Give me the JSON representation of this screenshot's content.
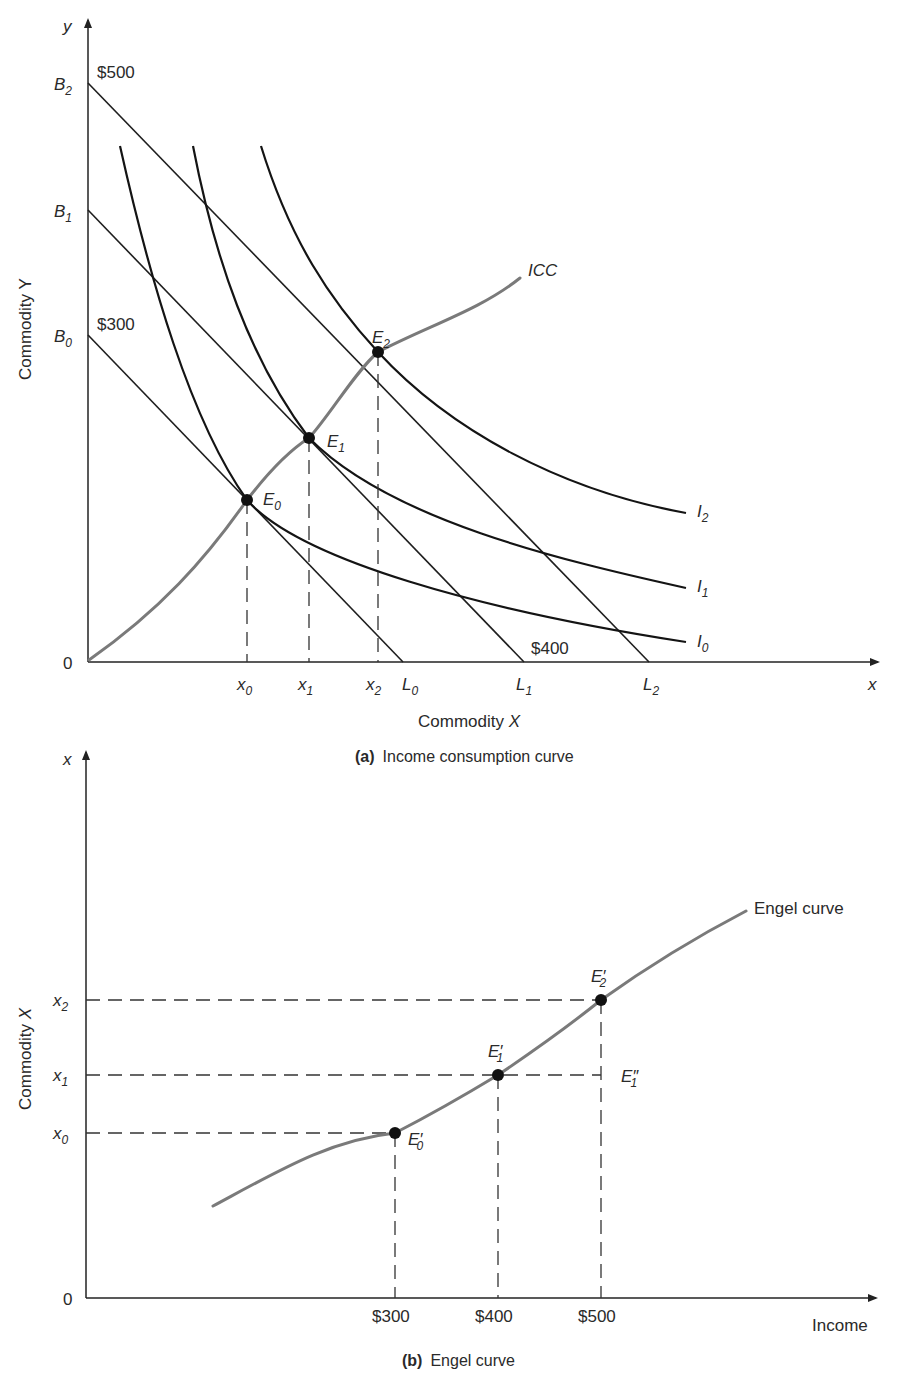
{
  "panel_a": {
    "caption_tag": "(a)",
    "caption_text": "Income consumption curve",
    "y_axis_symbol": "y",
    "x_axis_symbol": "x",
    "y_axis_title": "Commodity Y",
    "x_axis_title": "Commodity X",
    "origin": "0",
    "budget_intercepts_y": [
      {
        "base": "B",
        "sub": "0"
      },
      {
        "base": "B",
        "sub": "1"
      },
      {
        "base": "B",
        "sub": "2"
      }
    ],
    "budget_intercepts_x": [
      {
        "base": "L",
        "sub": "0"
      },
      {
        "base": "L",
        "sub": "1"
      },
      {
        "base": "L",
        "sub": "2"
      }
    ],
    "income_labels": {
      "b0": "$300",
      "b2": "$500",
      "l1": "$400"
    },
    "x_ticks": [
      {
        "base": "x",
        "sub": "0"
      },
      {
        "base": "x",
        "sub": "1"
      },
      {
        "base": "x",
        "sub": "2"
      }
    ],
    "equilibria": [
      {
        "base": "E",
        "sub": "0"
      },
      {
        "base": "E",
        "sub": "1"
      },
      {
        "base": "E",
        "sub": "2"
      }
    ],
    "indifference_curves": [
      {
        "base": "I",
        "sub": "0"
      },
      {
        "base": "I",
        "sub": "1"
      },
      {
        "base": "I",
        "sub": "2"
      }
    ],
    "icc_label": "ICC"
  },
  "panel_b": {
    "caption_tag": "(b)",
    "caption_text": "Engel curve",
    "y_axis_symbol": "x",
    "y_axis_title": "Commodity X",
    "x_axis_title": "Income",
    "origin": "0",
    "y_ticks": [
      {
        "base": "x",
        "sub": "0"
      },
      {
        "base": "x",
        "sub": "1"
      },
      {
        "base": "x",
        "sub": "2"
      }
    ],
    "x_ticks": [
      "$300",
      "$400",
      "$500"
    ],
    "points": [
      {
        "base": "E",
        "prime": "′",
        "sub": "0"
      },
      {
        "base": "E",
        "prime": "′",
        "sub": "1"
      },
      {
        "base": "E",
        "prime": "′",
        "sub": "2"
      },
      {
        "base": "E",
        "prime": "″",
        "sub": "1"
      }
    ],
    "curve_label": "Engel curve"
  },
  "colors": {
    "curve_gray": "#7a7a7a",
    "ink": "#1e1e1e"
  }
}
